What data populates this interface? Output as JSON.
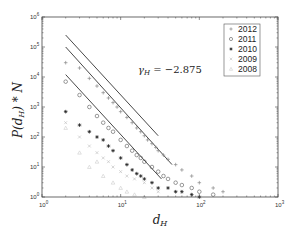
{
  "chart_data": {
    "type": "scatter",
    "title": "",
    "xlabel": "d_H",
    "ylabel": "P(d_H) * N",
    "xscale": "log",
    "yscale": "log",
    "xlim": [
      1,
      1000
    ],
    "ylim": [
      1,
      1000000
    ],
    "x_ticks": [
      "10^0",
      "10^1",
      "10^2",
      "10^3"
    ],
    "y_ticks": [
      "10^0",
      "10^1",
      "10^2",
      "10^3",
      "10^4",
      "10^5",
      "10^6"
    ],
    "grid": false,
    "legend_position": "upper right",
    "annotation": "γ_H = −2.875",
    "fit_slope": -2.875,
    "fit_lines": [
      {
        "name": "fit-2012",
        "x": [
          2,
          30
        ],
        "y": [
          250000,
          110
        ]
      },
      {
        "name": "fit-2011",
        "x": [
          2,
          45
        ],
        "y": [
          100000,
          12
        ]
      },
      {
        "name": "fit-2010",
        "x": [
          2,
          33
        ],
        "y": [
          12000,
          4
        ]
      }
    ],
    "series": [
      {
        "name": "2012",
        "marker": "+",
        "color": "#888888",
        "x": [
          2,
          3,
          4,
          5,
          6,
          7,
          8,
          9,
          10,
          12,
          14,
          16,
          18,
          20,
          22,
          25,
          28,
          30,
          35,
          40,
          50,
          60,
          80,
          100,
          150,
          200
        ],
        "y": [
          30000,
          20000,
          9000,
          5000,
          3000,
          2000,
          1400,
          1000,
          700,
          450,
          300,
          200,
          150,
          110,
          80,
          60,
          45,
          35,
          25,
          18,
          12,
          8,
          5,
          3,
          2,
          1.5
        ]
      },
      {
        "name": "2011",
        "marker": "o",
        "color": "#555555",
        "x": [
          2,
          3,
          4,
          5,
          6,
          7,
          8,
          10,
          12,
          14,
          16,
          18,
          20,
          25,
          30,
          35,
          40,
          50,
          60,
          80,
          100,
          150
        ],
        "y": [
          7000,
          2500,
          1000,
          500,
          300,
          200,
          150,
          80,
          50,
          35,
          25,
          20,
          15,
          10,
          7,
          5,
          4,
          3,
          2.5,
          2,
          1.5,
          1.2
        ]
      },
      {
        "name": "2010",
        "marker": "*",
        "color": "#222222",
        "x": [
          2,
          3,
          4,
          5,
          6,
          7,
          8,
          10,
          12,
          14,
          16,
          18,
          20,
          25,
          30,
          40,
          50,
          60,
          80,
          100
        ],
        "y": [
          700,
          250,
          150,
          100,
          80,
          50,
          35,
          20,
          12,
          8,
          6,
          5,
          4,
          3,
          2,
          2,
          1.5,
          1.5,
          1.2,
          1
        ]
      },
      {
        "name": "2009",
        "marker": "x",
        "color": "#bbbbbb",
        "x": [
          2,
          3,
          4,
          5,
          6,
          7,
          8,
          10,
          12,
          15,
          20,
          25,
          30
        ],
        "y": [
          300,
          100,
          50,
          30,
          20,
          15,
          10,
          7,
          5,
          4,
          3,
          2,
          1.5
        ]
      },
      {
        "name": "2008",
        "marker": "triangle",
        "color": "#cccccc",
        "x": [
          2,
          3,
          4,
          5,
          6,
          8,
          10,
          12,
          15,
          20
        ],
        "y": [
          200,
          30,
          10,
          15,
          5,
          3,
          2,
          1.5,
          1.2,
          1
        ]
      }
    ]
  },
  "legend": {
    "items": [
      {
        "label": "2012",
        "marker": "+",
        "color": "#888888"
      },
      {
        "label": "2011",
        "marker": "o",
        "color": "#555555"
      },
      {
        "label": "2010",
        "marker": "*",
        "color": "#222222"
      },
      {
        "label": "2009",
        "marker": "x",
        "color": "#bbbbbb"
      },
      {
        "label": "2008",
        "marker": "triangle",
        "color": "#cccccc"
      }
    ]
  },
  "axes": {
    "xlabel": "d_H",
    "ylabel": "P(d_H) * N",
    "annotation_prefix": "γ",
    "annotation_sub": "H",
    "annotation_value": " = −2.875"
  }
}
